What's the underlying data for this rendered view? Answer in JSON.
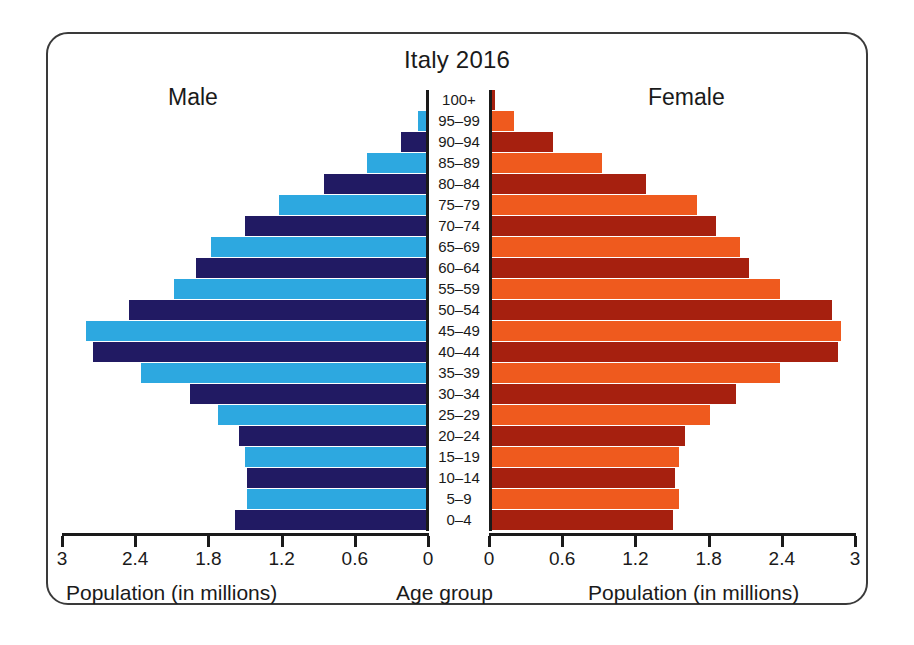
{
  "chart_data": {
    "type": "bar",
    "subtype": "population-pyramid",
    "title": "Italy 2016",
    "categories": [
      "100+",
      "95–99",
      "90–94",
      "85–89",
      "80–84",
      "75–79",
      "70–74",
      "65–69",
      "60–64",
      "55–59",
      "50–54",
      "45–49",
      "40–44",
      "35–39",
      "30–34",
      "25–29",
      "20–24",
      "15–19",
      "10–14",
      "5–9",
      "0–4"
    ],
    "series": [
      {
        "name": "Male",
        "side": "left",
        "values": [
          0.02,
          0.08,
          0.22,
          0.5,
          0.85,
          1.22,
          1.5,
          1.78,
          1.9,
          2.08,
          2.45,
          2.8,
          2.75,
          2.35,
          1.95,
          1.72,
          1.55,
          1.5,
          1.48,
          1.48,
          1.58
        ]
      },
      {
        "name": "Female",
        "side": "right",
        "values": [
          0.04,
          0.2,
          0.52,
          0.92,
          1.28,
          1.7,
          1.85,
          2.05,
          2.12,
          2.38,
          2.8,
          2.88,
          2.85,
          2.38,
          2.02,
          1.8,
          1.6,
          1.55,
          1.52,
          1.55,
          1.5
        ]
      }
    ],
    "xlabel": "Population (in millions)",
    "ylabel": "Age group",
    "xlim": [
      0,
      3
    ],
    "xticks": [
      0,
      0.6,
      1.2,
      1.8,
      2.4,
      3
    ],
    "xticklabels_left": [
      "3",
      "2.4",
      "1.8",
      "1.2",
      "0.6",
      "0"
    ],
    "xticklabels_right": [
      "0",
      "0.6",
      "1.2",
      "1.8",
      "2.4",
      "3"
    ],
    "grid": false,
    "legend": "inline-side-labels",
    "colors": {
      "male_dark": "#211a63",
      "male_light": "#2da8e0",
      "female_dark": "#a6200f",
      "female_light": "#ef5a1e",
      "axis": "#1a1a1a",
      "frame": "#3a3a3a",
      "background": "#ffffff"
    }
  },
  "labels": {
    "male": "Male",
    "female": "Female",
    "age_axis_title": "Age group",
    "population_axis_title": "Population (in millions)"
  }
}
